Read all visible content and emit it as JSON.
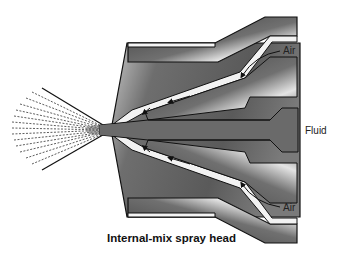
{
  "diagram": {
    "title": "Internal-mix spray head",
    "labels": {
      "air_top": "Air",
      "air_bottom": "Air",
      "fluid": "Fluid"
    },
    "colors": {
      "body_dark": "#555555",
      "body_light": "#bdbdbd",
      "channel": "#f2f2f2",
      "fluid": "#6a6a6a",
      "outline": "#111111"
    }
  }
}
